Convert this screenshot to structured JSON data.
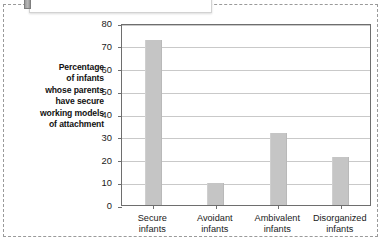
{
  "figure": {
    "caption_text": "(van IJzendoorn, 1995).",
    "tab_icon": "page-tab-marker"
  },
  "chart_data": {
    "type": "bar",
    "title": "",
    "subtitle": "",
    "xlabel": "",
    "ylabel": "Percentage of infants whose parents have secure working models of attachment",
    "ylabel_lines": [
      "Percentage",
      "of infants",
      "whose parents",
      "have secure",
      "working models",
      "of attachment"
    ],
    "categories": [
      "Secure infants",
      "Avoidant infants",
      "Ambivalent infants",
      "Disorganized infants"
    ],
    "category_lines": [
      [
        "Secure",
        "infants"
      ],
      [
        "Avoidant",
        "infants"
      ],
      [
        "Ambivalent",
        "infants"
      ],
      [
        "Disorganized",
        "infants"
      ]
    ],
    "values": [
      72.5,
      9.5,
      31.5,
      21
    ],
    "ylim": [
      0,
      80
    ],
    "ytick_labels": [
      "0",
      "10",
      "20",
      "30",
      "40",
      "50",
      "60",
      "70",
      "80"
    ],
    "ytick_values": [
      0,
      10,
      20,
      30,
      40,
      50,
      60,
      70,
      80
    ],
    "grid": true,
    "legend": false,
    "legend_position": "none",
    "bar_color": "#c5c5c5",
    "axis_color": "#6e6e6e",
    "grid_color": "#c9c9c9"
  }
}
